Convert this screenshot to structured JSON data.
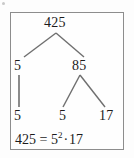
{
  "figure": {
    "kind": "factor-tree",
    "number": "425",
    "line_color": "#6f6f6f",
    "text_color": "#1b1b1b",
    "border_color": "#8d8d8d",
    "background": "#fefefe"
  },
  "tree": {
    "root": {
      "label": "425"
    },
    "level1": [
      {
        "label": "5"
      },
      {
        "label": "85"
      }
    ],
    "level2": [
      {
        "label": "5"
      },
      {
        "label": "5"
      },
      {
        "label": "17"
      }
    ]
  },
  "equation": {
    "full": "425 = 5²·17",
    "left": "425",
    "equals": "=",
    "base": "5",
    "exponent": "2",
    "dot": "·",
    "factor": "17"
  }
}
